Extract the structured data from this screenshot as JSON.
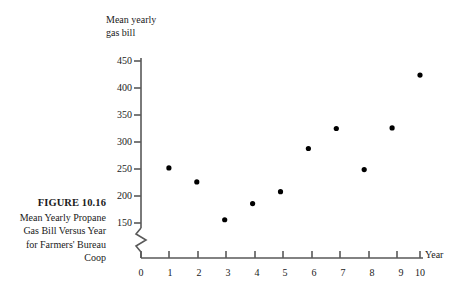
{
  "figure": {
    "number_label": "FIGURE 10.16",
    "caption_lines": [
      "Mean Yearly Propane",
      "Gas Bill Versus Year",
      "for Farmers' Bureau",
      "Coop"
    ]
  },
  "chart_data": {
    "type": "scatter",
    "title": "",
    "xlabel": "Year",
    "ylabel": "Mean yearly gas bill",
    "ylabel_lines": [
      "Mean yearly",
      "gas bill"
    ],
    "x": [
      1,
      2,
      3,
      4,
      5,
      6,
      7,
      8,
      9,
      10
    ],
    "values": [
      252,
      226,
      156,
      186,
      208,
      288,
      325,
      249,
      326,
      424
    ],
    "points": [
      {
        "x": 1,
        "y": 252
      },
      {
        "x": 2,
        "y": 226
      },
      {
        "x": 3,
        "y": 156
      },
      {
        "x": 4,
        "y": 186
      },
      {
        "x": 5,
        "y": 208
      },
      {
        "x": 6,
        "y": 288
      },
      {
        "x": 7,
        "y": 325
      },
      {
        "x": 8,
        "y": 249
      },
      {
        "x": 9,
        "y": 326
      },
      {
        "x": 10,
        "y": 424
      }
    ],
    "xticks": [
      "0",
      "1",
      "2",
      "3",
      "4",
      "5",
      "6",
      "7",
      "8",
      "9",
      "10"
    ],
    "yticks": [
      "150",
      "200",
      "250",
      "300",
      "350",
      "400",
      "450"
    ],
    "xlim": [
      0,
      10
    ],
    "ylim": [
      150,
      450
    ],
    "grid": false,
    "legend": false,
    "axis_break": true,
    "marker": "filled-circle",
    "marker_color": "#000000",
    "axis_color": "#595959"
  }
}
